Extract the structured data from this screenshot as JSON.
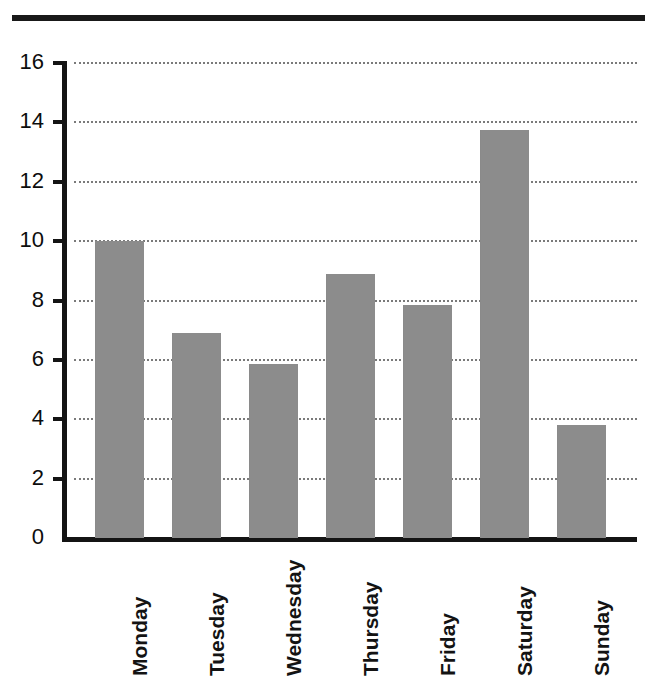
{
  "chart_data": {
    "type": "bar",
    "title": "",
    "subtitle": "",
    "xlabel": "",
    "ylabel": "",
    "categories": [
      "Monday",
      "Tuesday",
      "Wednesday",
      "Thursday",
      "Friday",
      "Saturday",
      "Sunday"
    ],
    "values": [
      10.0,
      6.9,
      5.85,
      8.9,
      7.85,
      13.75,
      3.8
    ],
    "series": [
      {
        "name": "",
        "values": [
          10.0,
          6.9,
          5.85,
          8.9,
          7.85,
          13.75,
          3.8
        ]
      }
    ],
    "ylim": [
      0,
      16
    ],
    "xlim": [
      0,
      7
    ],
    "ytick_labels": [
      "0",
      "2",
      "4",
      "6",
      "8",
      "10",
      "12",
      "14",
      "16"
    ],
    "ytick_values": [
      0,
      2,
      4,
      6,
      8,
      10,
      12,
      14,
      16
    ],
    "grid": "horizontal-dotted",
    "legend": "none",
    "legend_position": "",
    "annotations": [],
    "bar_color": "#8c8c8c",
    "axis_color": "#141414",
    "gridline_color": "#7a7a7a",
    "background_color": "#ffffff",
    "xtick_label_rotation": "90"
  },
  "decorations": {
    "top_rule_color": "#191919"
  }
}
